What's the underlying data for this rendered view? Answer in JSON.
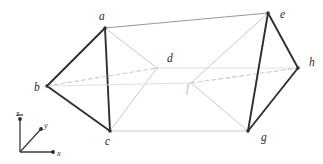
{
  "figure": {
    "background_color": "#ffffff",
    "stroke_dark": "#2f2f2f",
    "stroke_mid": "#8a8a8a",
    "stroke_light": "#c9c9c9",
    "stroke_faint": "#dcdcdc",
    "vertices": [
      {
        "id": "a",
        "label": "a",
        "x": 105,
        "y": 28,
        "label_x": 99,
        "label_y": 20,
        "tone": "dark"
      },
      {
        "id": "b",
        "label": "b",
        "x": 47,
        "y": 86,
        "label_x": 34,
        "label_y": 91,
        "tone": "dark"
      },
      {
        "id": "c",
        "label": "c",
        "x": 110,
        "y": 131,
        "label_x": 105,
        "label_y": 145,
        "tone": "dark"
      },
      {
        "id": "d",
        "label": "d",
        "x": 157,
        "y": 68,
        "label_x": 167,
        "label_y": 62,
        "tone": "light"
      },
      {
        "id": "e",
        "label": "e",
        "x": 268,
        "y": 13,
        "label_x": 280,
        "label_y": 18,
        "tone": "dark"
      },
      {
        "id": "f",
        "label": "f",
        "x": 191,
        "y": 83,
        "label_x": 186,
        "label_y": 92,
        "tone": "faint"
      },
      {
        "id": "g",
        "label": "g",
        "x": 248,
        "y": 131,
        "label_x": 261,
        "label_y": 141,
        "tone": "dark"
      },
      {
        "id": "h",
        "label": "h",
        "x": 298,
        "y": 68,
        "label_x": 309,
        "label_y": 66,
        "tone": "dark"
      }
    ],
    "edges": [
      {
        "from": "a",
        "to": "b",
        "style": "solid",
        "tone": "dark",
        "width": 1.9
      },
      {
        "from": "b",
        "to": "c",
        "style": "solid",
        "tone": "dark",
        "width": 1.9
      },
      {
        "from": "a",
        "to": "c",
        "style": "solid",
        "tone": "dark",
        "width": 1.9
      },
      {
        "from": "b",
        "to": "d",
        "style": "dashed",
        "tone": "light",
        "width": 1.1
      },
      {
        "from": "a",
        "to": "d",
        "style": "solid",
        "tone": "light",
        "width": 1.0
      },
      {
        "from": "c",
        "to": "d",
        "style": "solid",
        "tone": "light",
        "width": 1.0
      },
      {
        "from": "a",
        "to": "e",
        "style": "solid",
        "tone": "mid",
        "width": 0.9
      },
      {
        "from": "c",
        "to": "g",
        "style": "solid",
        "tone": "light",
        "width": 1.0
      },
      {
        "from": "d",
        "to": "h",
        "style": "solid",
        "tone": "faint",
        "width": 0.9
      },
      {
        "from": "e",
        "to": "f",
        "style": "solid",
        "tone": "light",
        "width": 1.0
      },
      {
        "from": "g",
        "to": "f",
        "style": "solid",
        "tone": "light",
        "width": 1.0
      },
      {
        "from": "f",
        "to": "h",
        "style": "dashed",
        "tone": "light",
        "width": 1.1
      },
      {
        "from": "e",
        "to": "g",
        "style": "solid",
        "tone": "dark",
        "width": 1.9
      },
      {
        "from": "e",
        "to": "h",
        "style": "solid",
        "tone": "dark",
        "width": 1.9
      },
      {
        "from": "g",
        "to": "h",
        "style": "solid",
        "tone": "dark",
        "width": 1.9
      },
      {
        "from": "b",
        "to": "f",
        "style": "solid",
        "tone": "faint",
        "width": 0.9
      }
    ]
  },
  "axes": {
    "origin": {
      "x": 20,
      "y": 152
    },
    "z": {
      "label": "z",
      "tip_x": 20,
      "tip_y": 119,
      "label_x": 16,
      "label_y": 116
    },
    "y": {
      "label": "y",
      "tip_x": 41,
      "tip_y": 129,
      "label_x": 44,
      "label_y": 128
    },
    "x": {
      "label": "x",
      "tip_x": 53,
      "tip_y": 152,
      "label_x": 57,
      "label_y": 156
    }
  }
}
